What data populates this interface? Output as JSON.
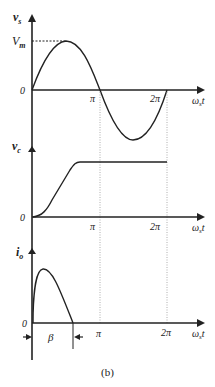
{
  "caption": "(b)",
  "plots": {
    "vs": {
      "ylabel_main": "v",
      "ylabel_sub": "s",
      "peak_label_main": "V",
      "peak_label_sub": "m",
      "origin": "0",
      "xlabel_main": "ω",
      "xlabel_sub": "s",
      "xlabel_tail": "t",
      "ticks": [
        "π",
        "2π"
      ]
    },
    "vc": {
      "ylabel_main": "v",
      "ylabel_sub": "c",
      "origin": "0",
      "xlabel_main": "ω",
      "xlabel_sub": "s",
      "xlabel_tail": "t",
      "ticks": [
        "π",
        "2π"
      ]
    },
    "io": {
      "ylabel_main": "i",
      "ylabel_sub": "o",
      "origin": "0",
      "xlabel_main": "ω",
      "xlabel_sub": "s",
      "xlabel_tail": "t",
      "ticks": [
        "π",
        "2π"
      ],
      "conduction_label": "β"
    }
  },
  "colors": {
    "stroke": "#222222",
    "dotted": "#888888"
  }
}
